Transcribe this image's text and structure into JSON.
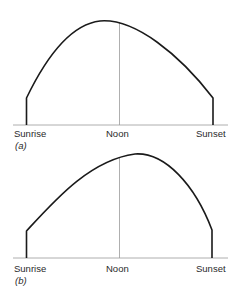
{
  "diagram": {
    "colors": {
      "curve": "#1a1a1a",
      "axis": "#999999",
      "noon_line": "#9a9a9a",
      "text": "#2a2a2a"
    },
    "panels": [
      {
        "tag": "(a)",
        "labels": {
          "left": "Sunrise",
          "center": "Noon",
          "right": "Sunset"
        },
        "peak_position": "before noon"
      },
      {
        "tag": "(b)",
        "labels": {
          "left": "Sunrise",
          "center": "Noon",
          "right": "Sunset"
        },
        "peak_position": "after noon"
      }
    ]
  }
}
